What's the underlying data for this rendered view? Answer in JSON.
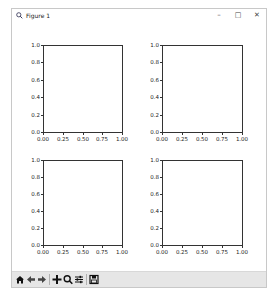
{
  "window": {
    "title": "Figure 1",
    "controls": {
      "minimize": "–",
      "maximize": "□",
      "close": "✕"
    }
  },
  "toolbar": {
    "buttons": [
      {
        "name": "home",
        "icon": "home-icon",
        "glyph": "⌂"
      },
      {
        "name": "back",
        "icon": "arrow-left-icon",
        "glyph": "←"
      },
      {
        "name": "forward",
        "icon": "arrow-right-icon",
        "glyph": "→"
      },
      {
        "name": "pan",
        "icon": "move-icon",
        "glyph": "✥"
      },
      {
        "name": "zoom",
        "icon": "magnifier-icon",
        "glyph": "🔍"
      },
      {
        "name": "configure-subplots",
        "icon": "sliders-icon",
        "glyph": "☰"
      },
      {
        "name": "save",
        "icon": "floppy-disk-icon",
        "glyph": "💾"
      }
    ]
  },
  "chart_data": [
    {
      "type": "line",
      "title": "",
      "xlabel": "",
      "ylabel": "",
      "position": "top-left",
      "xlim": [
        0,
        1
      ],
      "ylim": [
        0,
        1
      ],
      "xticks": [
        "0.00",
        "0.25",
        "0.50",
        "0.75",
        "1.00"
      ],
      "yticks": [
        "0.0",
        "0.2",
        "0.4",
        "0.6",
        "0.8",
        "1.0"
      ],
      "series": [],
      "grid": false
    },
    {
      "type": "line",
      "title": "",
      "xlabel": "",
      "ylabel": "",
      "position": "top-right",
      "xlim": [
        0,
        1
      ],
      "ylim": [
        0,
        1
      ],
      "xticks": [
        "0.00",
        "0.25",
        "0.50",
        "0.75",
        "1.00"
      ],
      "yticks": [
        "0.0",
        "0.2",
        "0.4",
        "0.6",
        "0.8",
        "1.0"
      ],
      "series": [],
      "grid": false
    },
    {
      "type": "line",
      "title": "",
      "xlabel": "",
      "ylabel": "",
      "position": "bottom-left",
      "xlim": [
        0,
        1
      ],
      "ylim": [
        0,
        1
      ],
      "xticks": [
        "0.00",
        "0.25",
        "0.50",
        "0.75",
        "1.00"
      ],
      "yticks": [
        "0.0",
        "0.2",
        "0.4",
        "0.6",
        "0.8",
        "1.0"
      ],
      "series": [],
      "grid": false
    },
    {
      "type": "line",
      "title": "",
      "xlabel": "",
      "ylabel": "",
      "position": "bottom-right",
      "xlim": [
        0,
        1
      ],
      "ylim": [
        0,
        1
      ],
      "xticks": [
        "0.00",
        "0.25",
        "0.50",
        "0.75",
        "1.00"
      ],
      "yticks": [
        "0.0",
        "0.2",
        "0.4",
        "0.6",
        "0.8",
        "1.0"
      ],
      "series": [],
      "grid": false
    }
  ]
}
